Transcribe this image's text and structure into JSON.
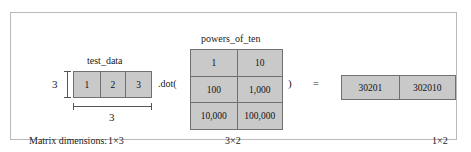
{
  "figure": {
    "labels": {
      "test_data": "test_data",
      "powers_of_ten": "powers_of_ten"
    },
    "operators": {
      "dot": ".dot(",
      "close_paren": ")",
      "equals": "="
    },
    "annotations": {
      "rows_marker": "3",
      "cols_marker": "3",
      "dimensions_label": "Matrix dimensions:",
      "dim_test_data": "1×3",
      "dim_powers_of_ten": "3×2",
      "dim_result": "1×2"
    },
    "colors": {
      "cell_fill": "#c9c9c9",
      "cell_border": "#707070",
      "frame_border": "#b9b9b9",
      "text": "#1a1a1a"
    }
  },
  "chart_data": {
    "type": "table",
    "matrices": [
      {
        "name": "test_data",
        "shape": "1×3",
        "rows": [
          [
            "1",
            "2",
            "3"
          ]
        ]
      },
      {
        "name": "powers_of_ten",
        "shape": "3×2",
        "rows": [
          [
            "1",
            "10"
          ],
          [
            "100",
            "1,000"
          ],
          [
            "10,000",
            "100,000"
          ]
        ]
      },
      {
        "name": "result",
        "shape": "1×2",
        "rows": [
          [
            "30201",
            "302010"
          ]
        ]
      }
    ]
  }
}
